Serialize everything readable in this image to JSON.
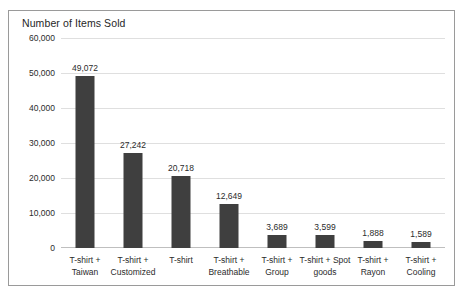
{
  "chart_data": {
    "type": "bar",
    "title": "Number of Items Sold",
    "xlabel": "",
    "ylabel": "",
    "ylim": [
      0,
      60000
    ],
    "ytick_values": [
      0,
      10000,
      20000,
      30000,
      40000,
      50000,
      60000
    ],
    "ytick_labels": [
      "0",
      "10,000",
      "20,000",
      "30,000",
      "40,000",
      "50,000",
      "60,000"
    ],
    "grid": true,
    "legend": "none",
    "bar_color": "#3f3f3f",
    "categories": [
      "T-shirt + Taiwan",
      "T-shirt + Customized",
      "T-shirt",
      "T-shirt + Breathable",
      "T-shirt + Group",
      "T-shirt + Spot goods",
      "T-shirt + Rayon",
      "T-shirt + Cooling"
    ],
    "category_lines": [
      [
        "T-shirt +",
        "Taiwan"
      ],
      [
        "T-shirt +",
        "Customized"
      ],
      [
        "T-shirt",
        ""
      ],
      [
        "T-shirt +",
        "Breathable"
      ],
      [
        "T-shirt +",
        "Group"
      ],
      [
        "T-shirt + Spot",
        "goods"
      ],
      [
        "T-shirt +",
        "Rayon"
      ],
      [
        "T-shirt +",
        "Cooling"
      ]
    ],
    "values": [
      49072,
      27242,
      20718,
      12649,
      3689,
      3599,
      1888,
      1589
    ],
    "value_labels": [
      "49,072",
      "27,242",
      "20,718",
      "12,649",
      "3,689",
      "3,599",
      "1,888",
      "1,589"
    ]
  }
}
